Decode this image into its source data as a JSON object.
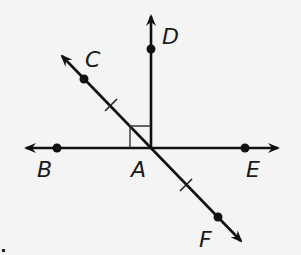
{
  "diagram": {
    "type": "geometry-lines",
    "points": [
      {
        "name": "A",
        "label": "A"
      },
      {
        "name": "B",
        "label": "B"
      },
      {
        "name": "C",
        "label": "C"
      },
      {
        "name": "D",
        "label": "D"
      },
      {
        "name": "E",
        "label": "E"
      },
      {
        "name": "F",
        "label": "F"
      }
    ],
    "labels": {
      "A": "A",
      "B": "B",
      "C": "C",
      "D": "D",
      "E": "E",
      "F": "F"
    },
    "marks": {
      "right_angle": "angle DAB",
      "congruent_segments": [
        "AC",
        "AF"
      ]
    }
  }
}
